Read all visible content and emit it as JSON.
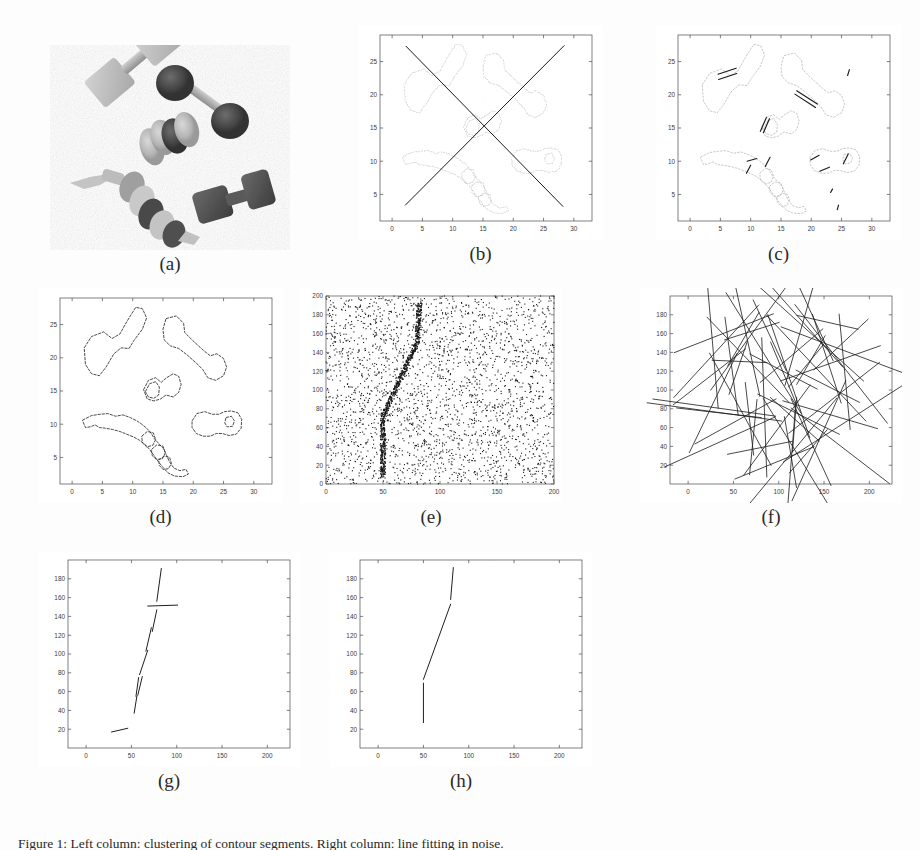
{
  "figure": {
    "width": 920,
    "height": 850,
    "background": "#fdfdfd",
    "bottom_caption": "Figure 1: Left column: clustering of contour segments. Right column: line fitting in noise.",
    "subfigure_labels": [
      "(a)",
      "(b)",
      "(c)",
      "(d)",
      "(e)",
      "(f)",
      "(g)",
      "(h)"
    ]
  },
  "panels": [
    {
      "id": "a",
      "label": "(a)",
      "kind": "image",
      "title": "",
      "description": "grayscale photograph of dumbbell-shaped objects on white background"
    },
    {
      "id": "b",
      "label": "(b)",
      "kind": "plot",
      "title": "Iteration 1, after (merge) & EM",
      "chart_ref": 0
    },
    {
      "id": "c",
      "label": "(c)",
      "kind": "plot",
      "title": "Iteration 2, after (merge) & EM",
      "chart_ref": 1
    },
    {
      "id": "d",
      "label": "(d)",
      "kind": "plot",
      "title": "Iteration 27, after split, before EM",
      "chart_ref": 2
    },
    {
      "id": "e",
      "label": "(e)",
      "kind": "plot",
      "title": "",
      "chart_ref": 3
    },
    {
      "id": "f",
      "label": "(f)",
      "kind": "plot",
      "title": "Iteration 1, after (merge) & EM",
      "chart_ref": 4
    },
    {
      "id": "g",
      "label": "(g)",
      "kind": "plot",
      "title": "Iteration 4, after split & EM",
      "chart_ref": 5
    },
    {
      "id": "h",
      "label": "(h)",
      "kind": "plot",
      "title": "Iteration 19, after split & EM",
      "chart_ref": 6
    }
  ],
  "chart_data": [
    {
      "panel": "b",
      "type": "scatter",
      "title": "Iteration 1, after (merge) & EM",
      "xlabel": "",
      "ylabel": "",
      "xlim": [
        -2,
        33
      ],
      "ylim": [
        1,
        29
      ],
      "xticks": [
        0,
        5,
        10,
        15,
        20,
        25,
        30
      ],
      "yticks": [
        5,
        10,
        15,
        20,
        25
      ],
      "grid": false,
      "legend": "none",
      "point_color": "#b8b8b8",
      "line_color": "#1a1a1a",
      "annotation": "light gray contour point cloud of objects with two long fitted lines crossing in an X",
      "fitted_lines": [
        {
          "x1": 2.3,
          "y1": 27.3,
          "x2": 28.2,
          "y2": 3.2
        },
        {
          "x1": 2.2,
          "y1": 3.4,
          "x2": 28.4,
          "y2": 27.4
        }
      ]
    },
    {
      "panel": "c",
      "type": "scatter",
      "title": "Iteration 2, after (merge) & EM",
      "xlabel": "",
      "ylabel": "",
      "xlim": [
        -2,
        33
      ],
      "ylim": [
        1,
        29
      ],
      "xticks": [
        0,
        5,
        10,
        15,
        20,
        25,
        30
      ],
      "yticks": [
        5,
        10,
        15,
        20,
        25
      ],
      "grid": false,
      "legend": "none",
      "point_color": "#b0b0b0",
      "line_color": "#1a1a1a",
      "annotation": "gray object contours with many short dark fitted segments on edges",
      "fitted_lines": [
        {
          "x1": 4.6,
          "y1": 23.1,
          "x2": 7.6,
          "y2": 24.0
        },
        {
          "x1": 4.7,
          "y1": 22.3,
          "x2": 7.7,
          "y2": 23.2
        },
        {
          "x1": 17.6,
          "y1": 20.6,
          "x2": 21.0,
          "y2": 18.6
        },
        {
          "x1": 17.3,
          "y1": 20.1,
          "x2": 20.7,
          "y2": 18.1
        },
        {
          "x1": 11.6,
          "y1": 14.5,
          "x2": 12.6,
          "y2": 16.6
        },
        {
          "x1": 12.1,
          "y1": 14.3,
          "x2": 13.1,
          "y2": 16.4
        },
        {
          "x1": 9.4,
          "y1": 10.0,
          "x2": 11.0,
          "y2": 10.4
        },
        {
          "x1": 12.4,
          "y1": 9.2,
          "x2": 13.2,
          "y2": 10.6
        },
        {
          "x1": 9.3,
          "y1": 8.2,
          "x2": 10.0,
          "y2": 9.4
        },
        {
          "x1": 19.9,
          "y1": 10.2,
          "x2": 21.3,
          "y2": 10.9
        },
        {
          "x1": 21.4,
          "y1": 8.5,
          "x2": 23.0,
          "y2": 9.1
        },
        {
          "x1": 25.3,
          "y1": 9.6,
          "x2": 26.1,
          "y2": 11.1
        },
        {
          "x1": 26.0,
          "y1": 22.9,
          "x2": 26.3,
          "y2": 23.8
        },
        {
          "x1": 23.2,
          "y1": 5.3,
          "x2": 23.5,
          "y2": 5.8
        },
        {
          "x1": 24.3,
          "y1": 2.7,
          "x2": 24.5,
          "y2": 3.4
        }
      ]
    },
    {
      "panel": "d",
      "type": "scatter",
      "title": "Iteration 27, after split, before EM",
      "xlabel": "",
      "ylabel": "",
      "xlim": [
        -2,
        33
      ],
      "ylim": [
        1,
        29
      ],
      "xticks": [
        0,
        5,
        10,
        15,
        20,
        25,
        30
      ],
      "yticks": [
        5,
        10,
        15,
        20,
        25
      ],
      "grid": false,
      "legend": "none",
      "point_color": "#2a2a2a",
      "line_color": "#1a1a1a",
      "annotation": "dark crisp contour outlines of all objects fully recovered"
    },
    {
      "panel": "e",
      "type": "scatter",
      "title": "",
      "xlabel": "",
      "ylabel": "",
      "xlim": [
        0,
        200
      ],
      "ylim": [
        0,
        200
      ],
      "xticks": [
        0,
        50,
        100,
        150,
        200
      ],
      "yticks": [
        0,
        20,
        40,
        60,
        80,
        100,
        120,
        140,
        160,
        180,
        200
      ],
      "grid": false,
      "legend": "none",
      "point_color": "#161616",
      "n_noise_points": 2600,
      "annotation": "uniform noise scatter with an embedded dense polyline cluster of inlier points",
      "inlier_polyline": [
        {
          "x": 50,
          "y": 8
        },
        {
          "x": 50,
          "y": 72
        },
        {
          "x": 80,
          "y": 150
        },
        {
          "x": 82,
          "y": 192
        }
      ]
    },
    {
      "panel": "f",
      "type": "scatter",
      "title": "Iteration 1, after (merge) & EM",
      "xlabel": "",
      "ylabel": "",
      "xlim": [
        -20,
        225
      ],
      "ylim": [
        0,
        200
      ],
      "xticks": [
        0,
        50,
        100,
        150,
        200
      ],
      "yticks": [
        20,
        40,
        60,
        80,
        100,
        120,
        140,
        160,
        180
      ],
      "grid": false,
      "legend": "none",
      "line_color": "#1f1f1f",
      "n_lines": 60,
      "annotation": "sixty randomly oriented long fitted line segments covering the field"
    },
    {
      "panel": "g",
      "type": "scatter",
      "title": "Iteration 4, after split & EM",
      "xlabel": "",
      "ylabel": "",
      "xlim": [
        -20,
        225
      ],
      "ylim": [
        0,
        200
      ],
      "xticks": [
        0,
        50,
        100,
        150,
        200
      ],
      "yticks": [
        20,
        40,
        60,
        80,
        100,
        120,
        140,
        160,
        180
      ],
      "grid": false,
      "legend": "none",
      "line_color": "#1f1f1f",
      "annotation": "nine short fitted segments roughly tracing the inlier polyline",
      "fitted_lines": [
        {
          "x1": 28,
          "y1": 17,
          "x2": 46,
          "y2": 21
        },
        {
          "x1": 53,
          "y1": 37,
          "x2": 56,
          "y2": 55
        },
        {
          "x1": 55,
          "y1": 55,
          "x2": 58,
          "y2": 75
        },
        {
          "x1": 57,
          "y1": 56,
          "x2": 62,
          "y2": 76
        },
        {
          "x1": 59,
          "y1": 78,
          "x2": 68,
          "y2": 104
        },
        {
          "x1": 66,
          "y1": 103,
          "x2": 72,
          "y2": 128
        },
        {
          "x1": 73,
          "y1": 124,
          "x2": 78,
          "y2": 147
        },
        {
          "x1": 68,
          "y1": 151,
          "x2": 101,
          "y2": 152
        },
        {
          "x1": 78,
          "y1": 156,
          "x2": 83,
          "y2": 191
        }
      ]
    },
    {
      "panel": "h",
      "type": "scatter",
      "title": "Iteration 19, after split & EM",
      "xlabel": "",
      "ylabel": "",
      "xlim": [
        -20,
        225
      ],
      "ylim": [
        0,
        200
      ],
      "xticks": [
        0,
        50,
        100,
        150,
        200
      ],
      "yticks": [
        20,
        40,
        60,
        80,
        100,
        120,
        140,
        160,
        180
      ],
      "grid": false,
      "legend": "none",
      "line_color": "#1f1f1f",
      "annotation": "three clean fitted segments recovering the true polyline",
      "fitted_lines": [
        {
          "x1": 50,
          "y1": 27,
          "x2": 50,
          "y2": 69
        },
        {
          "x1": 50,
          "y1": 73,
          "x2": 80,
          "y2": 153
        },
        {
          "x1": 80,
          "y1": 158,
          "x2": 83,
          "y2": 192
        }
      ]
    }
  ]
}
